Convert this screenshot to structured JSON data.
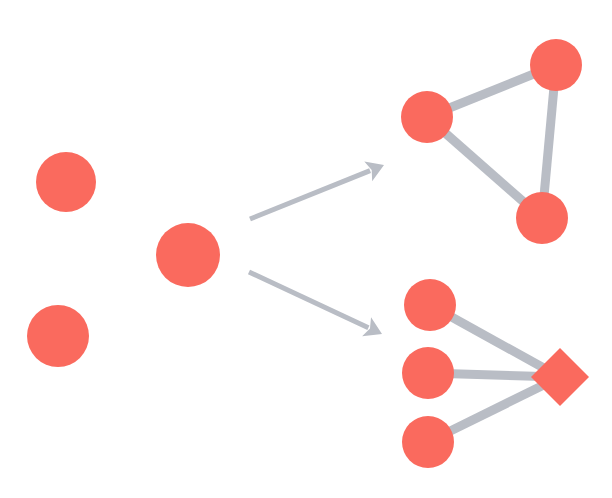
{
  "diagram": {
    "background_color": "#ffffff",
    "node_color": "#fa6a5e",
    "edge_color": "#b9bdc5",
    "arrow_color": "#b9bdc5",
    "width": 612,
    "height": 498
  },
  "groups": [
    {
      "id": "isolated-nodes",
      "label": "isolated nodes",
      "nodes": [
        {
          "id": "n1",
          "shape": "circle",
          "cx": 66,
          "cy": 182,
          "r": 30,
          "color": "#fa6a5e"
        },
        {
          "id": "n2",
          "shape": "circle",
          "cx": 188,
          "cy": 255,
          "r": 32,
          "color": "#fa6a5e"
        },
        {
          "id": "n3",
          "shape": "circle",
          "cx": 58,
          "cy": 336,
          "r": 31,
          "color": "#fa6a5e"
        }
      ],
      "edges": []
    },
    {
      "id": "triangle-motif",
      "label": "triangle motif",
      "nodes": [
        {
          "id": "t1",
          "shape": "circle",
          "cx": 427,
          "cy": 117,
          "r": 26,
          "color": "#fa6a5e"
        },
        {
          "id": "t2",
          "shape": "circle",
          "cx": 556,
          "cy": 65,
          "r": 26,
          "color": "#fa6a5e"
        },
        {
          "id": "t3",
          "shape": "circle",
          "cx": 542,
          "cy": 218,
          "r": 26,
          "color": "#fa6a5e"
        }
      ],
      "edges": [
        {
          "from": "t1",
          "to": "t2",
          "width": 9,
          "color": "#b9bdc5"
        },
        {
          "from": "t2",
          "to": "t3",
          "width": 9,
          "color": "#b9bdc5"
        },
        {
          "from": "t1",
          "to": "t3",
          "width": 9,
          "color": "#b9bdc5"
        }
      ]
    },
    {
      "id": "star-motif",
      "label": "star motif with hub",
      "nodes": [
        {
          "id": "s1",
          "shape": "circle",
          "cx": 430,
          "cy": 305,
          "r": 26,
          "color": "#fa6a5e"
        },
        {
          "id": "s2",
          "shape": "circle",
          "cx": 428,
          "cy": 373,
          "r": 26,
          "color": "#fa6a5e"
        },
        {
          "id": "s3",
          "shape": "circle",
          "cx": 428,
          "cy": 442,
          "r": 26,
          "color": "#fa6a5e"
        },
        {
          "id": "hub",
          "shape": "diamond",
          "cx": 560,
          "cy": 377,
          "r": 29,
          "color": "#fa6a5e"
        }
      ],
      "edges": [
        {
          "from": "s1",
          "to": "hub",
          "width": 9,
          "color": "#b9bdc5"
        },
        {
          "from": "s2",
          "to": "hub",
          "width": 9,
          "color": "#b9bdc5"
        },
        {
          "from": "s3",
          "to": "hub",
          "width": 9,
          "color": "#b9bdc5"
        }
      ]
    }
  ],
  "arrows": [
    {
      "id": "arrow-to-triangle",
      "label": "arrow to triangle motif",
      "x1": 250,
      "y1": 219,
      "x2": 384,
      "y2": 165,
      "width": 5,
      "head_size": 17,
      "color": "#b9bdc5"
    },
    {
      "id": "arrow-to-star",
      "label": "arrow to star motif",
      "x1": 249,
      "y1": 272,
      "x2": 382,
      "y2": 334,
      "width": 5,
      "head_size": 17,
      "color": "#b9bdc5"
    }
  ]
}
